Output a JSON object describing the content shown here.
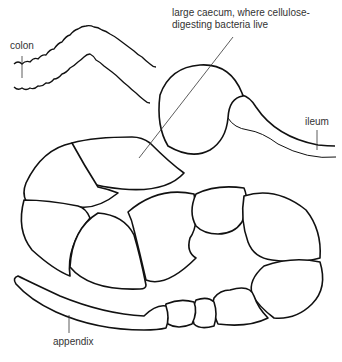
{
  "diagram": {
    "labels": {
      "caecum": [
        "large caecum, where cellulose-",
        "digesting bacteria live"
      ],
      "colon": "colon",
      "ileum": "ileum",
      "appendix": "appendix"
    },
    "colors": {
      "line": "#111111",
      "text": "#333333",
      "background": "#ffffff"
    }
  }
}
